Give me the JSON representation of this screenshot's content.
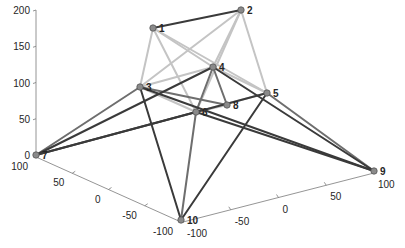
{
  "chart_data": {
    "type": "graph3d",
    "title": "",
    "axes": {
      "z": {
        "ticks": [
          0,
          50,
          100,
          150,
          200
        ],
        "range": [
          0,
          200
        ]
      },
      "x": {
        "ticks": [
          100,
          50,
          0,
          -50,
          -100
        ],
        "range": [
          -100,
          100
        ]
      },
      "y": {
        "ticks": [
          -100,
          -50,
          0,
          50,
          100
        ],
        "range": [
          -100,
          100
        ]
      }
    },
    "nodes": [
      {
        "id": "1",
        "label": "1",
        "px": 153,
        "py": 28
      },
      {
        "id": "2",
        "label": "2",
        "px": 241,
        "py": 10
      },
      {
        "id": "3",
        "label": "3",
        "px": 140,
        "py": 87
      },
      {
        "id": "4",
        "label": "4",
        "px": 213,
        "py": 67
      },
      {
        "id": "5",
        "label": "5",
        "px": 267,
        "py": 93
      },
      {
        "id": "6",
        "label": "6",
        "px": 196,
        "py": 112
      },
      {
        "id": "7",
        "label": "7",
        "px": 36,
        "py": 155
      },
      {
        "id": "8",
        "label": "8",
        "px": 227,
        "py": 105
      },
      {
        "id": "9",
        "label": "9",
        "px": 374,
        "py": 171
      },
      {
        "id": "10",
        "label": "10",
        "px": 181,
        "py": 220
      }
    ],
    "edges": [
      {
        "from": "1",
        "to": "2",
        "shade": "dark"
      },
      {
        "from": "1",
        "to": "3",
        "shade": "light"
      },
      {
        "from": "1",
        "to": "4",
        "shade": "light"
      },
      {
        "from": "1",
        "to": "5",
        "shade": "light"
      },
      {
        "from": "1",
        "to": "6",
        "shade": "light"
      },
      {
        "from": "2",
        "to": "3",
        "shade": "light"
      },
      {
        "from": "2",
        "to": "4",
        "shade": "light"
      },
      {
        "from": "2",
        "to": "5",
        "shade": "light"
      },
      {
        "from": "2",
        "to": "6",
        "shade": "light"
      },
      {
        "from": "3",
        "to": "4",
        "shade": "light"
      },
      {
        "from": "3",
        "to": "6",
        "shade": "light"
      },
      {
        "from": "3",
        "to": "8",
        "shade": "mid"
      },
      {
        "from": "4",
        "to": "5",
        "shade": "light"
      },
      {
        "from": "4",
        "to": "8",
        "shade": "mid"
      },
      {
        "from": "4",
        "to": "6",
        "shade": "mid"
      },
      {
        "from": "6",
        "to": "8",
        "shade": "light"
      },
      {
        "from": "6",
        "to": "5",
        "shade": "light"
      },
      {
        "from": "7",
        "to": "3",
        "shade": "mid"
      },
      {
        "from": "7",
        "to": "4",
        "shade": "dark"
      },
      {
        "from": "7",
        "to": "6",
        "shade": "dark"
      },
      {
        "from": "7",
        "to": "5",
        "shade": "dark"
      },
      {
        "from": "3",
        "to": "9",
        "shade": "dark"
      },
      {
        "from": "4",
        "to": "9",
        "shade": "dark"
      },
      {
        "from": "5",
        "to": "9",
        "shade": "mid"
      },
      {
        "from": "6",
        "to": "9",
        "shade": "dark"
      },
      {
        "from": "3",
        "to": "10",
        "shade": "dark"
      },
      {
        "from": "6",
        "to": "10",
        "shade": "mid"
      },
      {
        "from": "5",
        "to": "10",
        "shade": "dark"
      }
    ],
    "colors": {
      "dark": "#3a3a3a",
      "mid": "#6e6e6e",
      "light": "#c4c4c4",
      "node": "#8a8a8a",
      "axis": "#7a7a7a",
      "text": "#262626"
    },
    "grid": false,
    "legend": null
  }
}
